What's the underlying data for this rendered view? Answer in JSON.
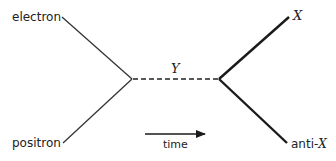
{
  "diagram": {
    "type": "feynman-diagram",
    "labels": {
      "electron": "electron",
      "positron": "positron",
      "mediator": "Y",
      "outgoing_particle": "X",
      "outgoing_antiparticle_prefix": "anti-",
      "outgoing_antiparticle_symbol": "X",
      "time_axis": "time"
    },
    "lines": {
      "incoming_color": "#333333",
      "outgoing_color": "#1a1a1a",
      "mediator_style": "dashed"
    }
  }
}
